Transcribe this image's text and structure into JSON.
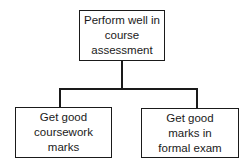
{
  "diagram": {
    "type": "hierarchy",
    "root": {
      "label_lines": [
        "Perform well in",
        "course",
        "assessment"
      ]
    },
    "children": [
      {
        "label_lines": [
          "Get good",
          "coursework",
          "marks"
        ]
      },
      {
        "label_lines": [
          "Get good",
          "marks in",
          "formal exam"
        ]
      }
    ]
  }
}
